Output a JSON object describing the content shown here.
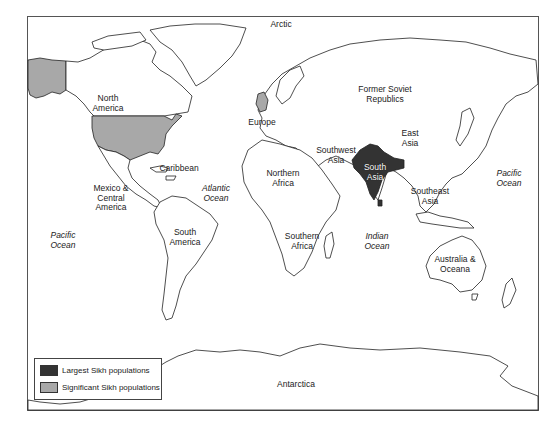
{
  "map": {
    "subject": "World map of Sikh populations by region",
    "colors": {
      "largest": "#333333",
      "significant": "#a8a8a8",
      "land": "#ffffff",
      "outline": "#222222"
    },
    "regions": [
      {
        "id": "arctic",
        "label": "Arctic",
        "x": 281,
        "y": 22,
        "category": "none"
      },
      {
        "id": "north-america",
        "label": "North\nAmerica",
        "x": 108,
        "y": 97,
        "category": "none"
      },
      {
        "id": "former-soviet",
        "label": "Former Soviet\nRepublics",
        "x": 385,
        "y": 89,
        "category": "none"
      },
      {
        "id": "europe",
        "label": "Europe",
        "x": 262,
        "y": 123,
        "category": "none"
      },
      {
        "id": "east-asia",
        "label": "East\nAsia",
        "x": 410,
        "y": 133,
        "category": "none"
      },
      {
        "id": "southwest-asia",
        "label": "Southwest\nAsia",
        "x": 336,
        "y": 151,
        "category": "none"
      },
      {
        "id": "south-asia",
        "label": "South\nAsia",
        "x": 377,
        "y": 168,
        "category": "largest"
      },
      {
        "id": "caribbean",
        "label": "Caribbean",
        "x": 179,
        "y": 169,
        "category": "none"
      },
      {
        "id": "northern-africa",
        "label": "Northern\nAfrica",
        "x": 285,
        "y": 174,
        "category": "none"
      },
      {
        "id": "atlantic-ocean",
        "label": "Atlantic\nOcean",
        "x": 216,
        "y": 189,
        "category": "ocean"
      },
      {
        "id": "mexico-central-america",
        "label": "Mexico &\nCentral\nAmerica",
        "x": 111,
        "y": 191,
        "category": "none"
      },
      {
        "id": "southeast-asia",
        "label": "Southeast\nAsia",
        "x": 432,
        "y": 192,
        "category": "none"
      },
      {
        "id": "pacific-ocean-east",
        "label": "Pacific\nOcean",
        "x": 507,
        "y": 174,
        "category": "ocean"
      },
      {
        "id": "south-america",
        "label": "South\nAmerica",
        "x": 185,
        "y": 233,
        "category": "none"
      },
      {
        "id": "pacific-ocean-west",
        "label": "Pacific\nOcean",
        "x": 63,
        "y": 236,
        "category": "ocean"
      },
      {
        "id": "southern-africa",
        "label": "Southern\nAfrica",
        "x": 302,
        "y": 237,
        "category": "none"
      },
      {
        "id": "indian-ocean",
        "label": "Indian\nOcean",
        "x": 374,
        "y": 237,
        "category": "ocean"
      },
      {
        "id": "australia-oceana",
        "label": "Australia &\nOceana",
        "x": 455,
        "y": 260,
        "category": "none"
      },
      {
        "id": "antarctica",
        "label": "Antarctica",
        "x": 296,
        "y": 385,
        "category": "none"
      }
    ],
    "highlighted": {
      "largest": [
        "India",
        "Pakistan",
        "Bangladesh",
        "Sri Lanka"
      ],
      "significant": [
        "United States",
        "Alaska",
        "United Kingdom"
      ]
    }
  },
  "legend": {
    "items": [
      {
        "label": "Largest Sikh populations",
        "color": "#333333"
      },
      {
        "label": "Significant Sikh populations",
        "color": "#a8a8a8"
      }
    ]
  }
}
